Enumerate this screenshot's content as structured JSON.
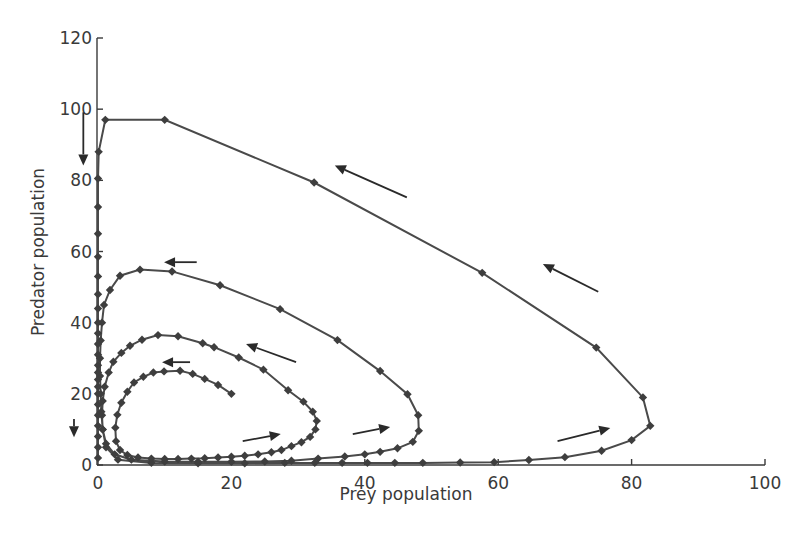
{
  "chart_data": {
    "type": "line",
    "title": "",
    "xlabel": "Prey population",
    "ylabel": "Predator population",
    "xlim": [
      0,
      100
    ],
    "ylim": [
      0,
      120
    ],
    "xticks": [
      0,
      20,
      40,
      60,
      80,
      100
    ],
    "yticks": [
      0,
      20,
      40,
      60,
      80,
      100,
      120
    ],
    "xtick_labels": [
      "0",
      "20",
      "40",
      "60",
      "80",
      "100"
    ],
    "ytick_labels": [
      "0",
      "20",
      "40",
      "60",
      "80",
      "100",
      "120"
    ],
    "grid": false,
    "legend": null,
    "marker": "diamond",
    "series": [
      {
        "name": "trajectory",
        "points": [
          [
            20,
            20
          ],
          [
            18,
            22.5
          ],
          [
            16,
            24.2
          ],
          [
            14.2,
            25.6
          ],
          [
            12.3,
            26.5
          ],
          [
            9.9,
            26.3
          ],
          [
            8.3,
            26
          ],
          [
            6.8,
            24.8
          ],
          [
            5.4,
            23.2
          ],
          [
            4.4,
            20.6
          ],
          [
            3.5,
            17.5
          ],
          [
            2.9,
            14.1
          ],
          [
            2.6,
            10.5
          ],
          [
            2.7,
            6.7
          ],
          [
            3.3,
            4.2
          ],
          [
            4.4,
            2.8
          ],
          [
            6,
            2.1
          ],
          [
            8,
            1.8
          ],
          [
            10,
            1.7
          ],
          [
            12,
            1.7
          ],
          [
            14,
            1.8
          ],
          [
            16,
            1.9
          ],
          [
            18,
            2.1
          ],
          [
            20,
            2.3
          ],
          [
            22,
            2.6
          ],
          [
            24,
            3.0
          ],
          [
            26,
            3.6
          ],
          [
            27.5,
            4.2
          ],
          [
            29,
            5.3
          ],
          [
            30.5,
            6.4
          ],
          [
            31.8,
            7.9
          ],
          [
            32.6,
            10
          ],
          [
            32.8,
            12.4
          ],
          [
            32.2,
            15
          ],
          [
            30.8,
            17.8
          ],
          [
            28.5,
            21
          ],
          [
            24.8,
            26.8
          ],
          [
            21.1,
            30.2
          ],
          [
            17.4,
            33.1
          ],
          [
            15.7,
            34.2
          ],
          [
            12.0,
            36.2
          ],
          [
            9.0,
            36.5
          ],
          [
            6.6,
            35.2
          ],
          [
            4.8,
            33.5
          ],
          [
            3.5,
            31.5
          ],
          [
            2.3,
            29.0
          ],
          [
            1.6,
            26
          ],
          [
            1.0,
            22
          ],
          [
            0.7,
            18
          ],
          [
            0.6,
            14
          ],
          [
            0.7,
            10
          ],
          [
            1.2,
            6
          ],
          [
            2.5,
            3.0
          ],
          [
            5,
            1.5
          ],
          [
            10,
            1.0
          ],
          [
            15,
            0.9
          ],
          [
            20,
            0.9
          ],
          [
            25,
            1.0
          ],
          [
            29,
            1.2
          ],
          [
            33,
            1.8
          ],
          [
            37,
            2.4
          ],
          [
            40,
            3.0
          ],
          [
            42.3,
            3.7
          ],
          [
            44.9,
            4.7
          ],
          [
            47.2,
            6.5
          ],
          [
            48.1,
            9.6
          ],
          [
            48.0,
            14.0
          ],
          [
            46.4,
            19.9
          ],
          [
            42.3,
            26.4
          ],
          [
            35.9,
            35.1
          ],
          [
            27.3,
            43.8
          ],
          [
            18.3,
            50.5
          ],
          [
            11.1,
            54.4
          ],
          [
            6.3,
            54.9
          ],
          [
            3.3,
            53.2
          ],
          [
            1.8,
            49.2
          ],
          [
            0.9,
            45.0
          ],
          [
            0.6,
            40.0
          ],
          [
            0.4,
            35
          ],
          [
            0.3,
            30
          ],
          [
            0.3,
            25
          ],
          [
            0.4,
            20
          ],
          [
            0.5,
            15
          ],
          [
            0.7,
            10
          ],
          [
            1.2,
            5
          ],
          [
            3,
            1.5
          ],
          [
            8,
            0.6
          ],
          [
            15,
            0.5
          ],
          [
            22,
            0.5
          ],
          [
            28,
            0.6
          ],
          [
            32.5,
            0.6
          ],
          [
            36.6,
            0.6
          ],
          [
            40.4,
            0.6
          ],
          [
            44.5,
            0.6
          ],
          [
            48.7,
            0.6
          ],
          [
            54.3,
            0.7
          ],
          [
            59.4,
            0.8
          ],
          [
            64.6,
            1.4
          ],
          [
            70,
            2.2
          ],
          [
            75.5,
            4.0
          ],
          [
            80.0,
            7.0
          ],
          [
            82.8,
            11.0
          ],
          [
            81.7,
            19.0
          ],
          [
            74.7,
            33.0
          ],
          [
            57.6,
            54.0
          ],
          [
            32.4,
            79.4
          ],
          [
            10.0,
            97.0
          ],
          [
            1.1,
            97.0
          ],
          [
            0.1,
            88.0
          ],
          [
            0,
            80.5
          ],
          [
            0,
            72.5
          ],
          [
            0,
            65
          ],
          [
            0,
            58.5
          ],
          [
            0,
            53
          ],
          [
            0,
            48
          ],
          [
            0,
            44
          ],
          [
            0,
            40
          ],
          [
            0,
            37
          ],
          [
            0,
            34
          ],
          [
            0,
            31
          ],
          [
            0,
            28
          ],
          [
            0,
            26
          ],
          [
            0,
            24
          ],
          [
            0,
            22
          ],
          [
            0,
            20
          ],
          [
            0,
            17
          ],
          [
            0,
            14
          ],
          [
            0,
            11
          ],
          [
            0,
            8
          ],
          [
            0,
            5
          ],
          [
            0,
            2
          ]
        ]
      }
    ],
    "annotations": [
      {
        "type": "arrow",
        "from": [
          46.3,
          75.2
        ],
        "to": [
          35.5,
          84.2
        ],
        "note": "outer loop, top"
      },
      {
        "type": "arrow",
        "from": [
          75.0,
          48.7
        ],
        "to": [
          66.7,
          56.5
        ],
        "note": "outer loop, right"
      },
      {
        "type": "arrow",
        "from": [
          14.8,
          57.0
        ],
        "to": [
          9.9,
          57.0
        ],
        "note": "second loop, top"
      },
      {
        "type": "arrow",
        "from": [
          29.7,
          28.9
        ],
        "to": [
          22.2,
          34.0
        ],
        "note": "second loop, right"
      },
      {
        "type": "arrow",
        "from": [
          13.8,
          28.9
        ],
        "to": [
          9.6,
          28.9
        ],
        "note": "inner loop, top"
      },
      {
        "type": "arrow",
        "from": [
          21.7,
          6.7
        ],
        "to": [
          27.4,
          8.7
        ],
        "note": "inner loop, bottom"
      },
      {
        "type": "arrow",
        "from": [
          38.2,
          8.7
        ],
        "to": [
          43.8,
          10.7
        ],
        "note": "second loop, bottom"
      },
      {
        "type": "arrow",
        "from": [
          68.9,
          6.7
        ],
        "to": [
          76.8,
          10.4
        ],
        "note": "outer loop, bottom"
      },
      {
        "type": "arrow",
        "from": [
          -2.2,
          99.1
        ],
        "to": [
          -2.2,
          84.2
        ],
        "note": "down along predator axis, top"
      },
      {
        "type": "arrow",
        "from": [
          -3.6,
          12.9
        ],
        "to": [
          -3.6,
          7.8
        ],
        "note": "down along predator axis, bottom"
      }
    ]
  },
  "axes": {
    "x_label": "Prey population",
    "y_label": "Predator population"
  }
}
